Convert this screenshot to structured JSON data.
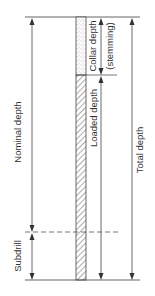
{
  "diagram": {
    "colors": {
      "line": "#555555",
      "text": "#333333",
      "stemming_fill": "#ffffff",
      "hatch": "#444444"
    },
    "labels": {
      "collar_depth": "Collar depth",
      "stemming": "(stemming)",
      "loaded_depth": "Loaded depth",
      "nominal_depth": "Nominal depth",
      "total_depth": "Total depth",
      "subdrill": "Subdrill"
    }
  }
}
